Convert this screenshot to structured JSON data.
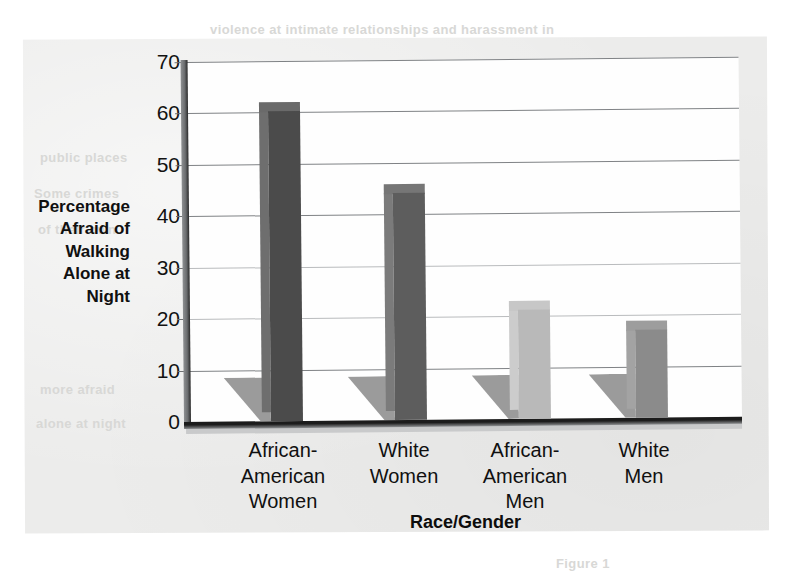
{
  "chart_data": {
    "type": "bar",
    "title": "",
    "xlabel": "Race/Gender",
    "ylabel": "Percentage Afraid of Walking Alone at Night",
    "ylabel_lines": [
      "Percentage",
      "Afraid of",
      "Walking",
      "Alone at",
      "Night"
    ],
    "categories": [
      "African-\nAmerican\nWomen",
      "White\nWomen",
      "African-\nAmerican\nMen",
      "White\nMen"
    ],
    "category_lines": [
      [
        "African-",
        "American",
        "Women"
      ],
      [
        "White",
        "Women"
      ],
      [
        "African-",
        "American",
        "Men"
      ],
      [
        "White",
        "Men"
      ]
    ],
    "values": [
      60,
      44,
      21,
      17
    ],
    "ylim": [
      0,
      70
    ],
    "yticks": [
      0,
      10,
      20,
      30,
      40,
      50,
      60,
      70
    ],
    "ytick_labels": [
      "0",
      "10",
      "20",
      "30",
      "40",
      "50",
      "60",
      "70"
    ],
    "grid": true,
    "legend": "none",
    "bar_colors": [
      "#4b4b4b",
      "#5d5d5d",
      "#b9b9b9",
      "#8b8b8b"
    ],
    "bar_side_colors": [
      "#6e6e6e",
      "#7b7b7b",
      "#cccccc",
      "#a3a3a3"
    ],
    "bar_top_colors": [
      "#6a6a6a",
      "#767676",
      "#c7c7c7",
      "#9d9d9d"
    ],
    "shadow_color": "#9b9b9b"
  },
  "page": {
    "background_color": "#ececeb",
    "outer_color": "#ffffff",
    "axis_color": "#1c1c1c",
    "grid_color": "#7f8285",
    "text_color": "#101010"
  },
  "ghost_text": [
    {
      "text": "violence at intimate relationships and harassment in",
      "x": 210,
      "y": 22
    },
    {
      "text": "public places",
      "x": 40,
      "y": 150
    },
    {
      "text": "Some crimes",
      "x": 34,
      "y": 186
    },
    {
      "text": "of their own",
      "x": 38,
      "y": 222
    },
    {
      "text": "Nearly half",
      "x": 620,
      "y": 168
    },
    {
      "text": "than men",
      "x": 630,
      "y": 204
    },
    {
      "text": "survey",
      "x": 636,
      "y": 294
    },
    {
      "text": "more afraid",
      "x": 40,
      "y": 382
    },
    {
      "text": "alone at night",
      "x": 36,
      "y": 416
    },
    {
      "text": "Figure 1",
      "x": 556,
      "y": 556
    }
  ]
}
